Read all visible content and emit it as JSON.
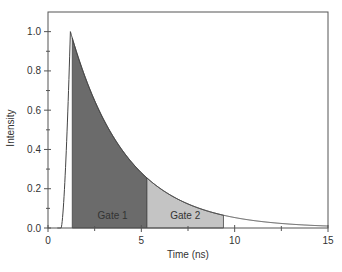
{
  "chart_data": {
    "type": "area",
    "title": "",
    "xlabel": "Time (ns)",
    "ylabel": "Intensity",
    "xlim": [
      0,
      15
    ],
    "ylim": [
      0,
      1.1
    ],
    "x_ticks": [
      0,
      5,
      10,
      15
    ],
    "x_tick_labels": [
      "0",
      "5",
      "10",
      "15"
    ],
    "y_ticks": [
      0.0,
      0.2,
      0.4,
      0.6,
      0.8,
      1.0
    ],
    "y_tick_labels": [
      "0.0",
      "0.2",
      "0.4",
      "0.6",
      "0.8",
      "1.0"
    ],
    "grid": false,
    "legend": null,
    "series": [
      {
        "name": "Fluorescence decay",
        "rise_start_ns": 0.7,
        "peak_time_ns": 1.2,
        "peak_value": 1.0,
        "decay_tau_ns": 3.0,
        "x": [
          0.7,
          0.9,
          1.0,
          1.2,
          2,
          3,
          4,
          5,
          5.3,
          6,
          7,
          8,
          9,
          9.4,
          10,
          11,
          12,
          13,
          14,
          15
        ],
        "values": [
          0.0,
          0.3,
          0.7,
          1.0,
          0.77,
          0.55,
          0.39,
          0.28,
          0.26,
          0.2,
          0.15,
          0.1,
          0.075,
          0.065,
          0.05,
          0.037,
          0.026,
          0.019,
          0.013,
          0.01
        ]
      }
    ],
    "annotations": [
      {
        "label": "Gate 1",
        "x_start": 1.3,
        "x_end": 5.3,
        "fill": "#6b6b6b"
      },
      {
        "label": "Gate 2",
        "x_start": 5.3,
        "x_end": 9.4,
        "fill": "#c4c4c4"
      }
    ]
  },
  "labels": {
    "gate1": "Gate 1",
    "gate2": "Gate 2",
    "xlabel": "Time (ns)",
    "ylabel": "Intensity"
  }
}
